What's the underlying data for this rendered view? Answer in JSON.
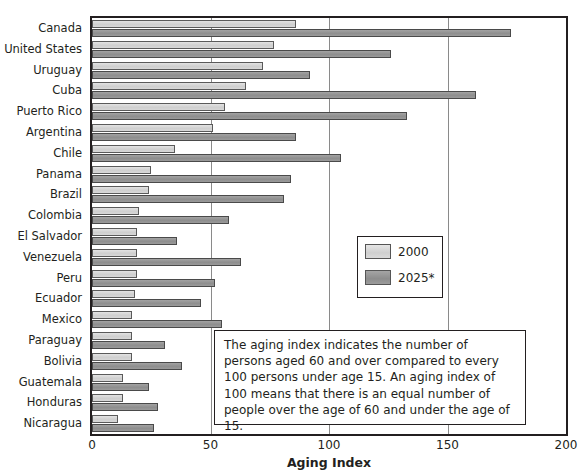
{
  "chart_data": {
    "type": "bar",
    "orientation": "horizontal",
    "title": "",
    "xlabel": "Aging Index",
    "ylabel": "",
    "xlim": [
      0,
      200
    ],
    "xticks": [
      0,
      50,
      100,
      150,
      200
    ],
    "grid": true,
    "legend_position": "middle-right",
    "categories": [
      "Canada",
      "United States",
      "Uruguay",
      "Cuba",
      "Puerto Rico",
      "Argentina",
      "Chile",
      "Panama",
      "Brazil",
      "Colombia",
      "El Salvador",
      "Venezuela",
      "Peru",
      "Ecuador",
      "Mexico",
      "Paraguay",
      "Bolivia",
      "Guatemala",
      "Honduras",
      "Nicaragua"
    ],
    "series": [
      {
        "name": "2000",
        "color": "#d4d4d4",
        "values": [
          86,
          77,
          72,
          65,
          56,
          51,
          35,
          25,
          24,
          20,
          19,
          19,
          19,
          18,
          17,
          17,
          17,
          13,
          13,
          11
        ]
      },
      {
        "name": "2025*",
        "color": "#939393",
        "values": [
          177,
          126,
          92,
          162,
          133,
          86,
          105,
          84,
          81,
          58,
          36,
          63,
          52,
          46,
          55,
          31,
          38,
          24,
          28,
          26
        ]
      }
    ],
    "annotations": [
      "The aging index indicates the number of persons aged 60 and over compared to every 100 persons under age 15. An aging index of 100 means that there is an equal number of people over the age of 60 and under the age of 15."
    ]
  },
  "legend": {
    "items": [
      {
        "label": "2000"
      },
      {
        "label": "2025*"
      }
    ]
  },
  "note": {
    "text": "The aging index indicates the number of persons aged 60 and over compared to every 100 persons under age 15. An aging index of 100 means that there is an equal number of people over the age of 60 and under the age of 15."
  },
  "axis": {
    "x_title": "Aging Index"
  }
}
